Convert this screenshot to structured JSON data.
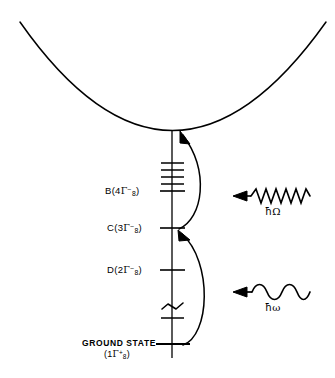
{
  "figure": {
    "background_color": "#ffffff",
    "ink_color": "#000000",
    "width": 335,
    "height": 378
  },
  "levels": [
    {
      "id": "B",
      "label_prefix": "B",
      "open_paren": "(",
      "number": "4",
      "gamma": "Γ",
      "subscript": "8",
      "superscript": "−",
      "close_paren": ")",
      "y": 191
    },
    {
      "id": "C",
      "label_prefix": "C",
      "open_paren": "(",
      "number": "3",
      "gamma": "Γ",
      "subscript": "8",
      "superscript": "−",
      "close_paren": ")",
      "y": 228
    },
    {
      "id": "D",
      "label_prefix": "D",
      "open_paren": "(",
      "number": "2",
      "gamma": "Γ",
      "subscript": "8",
      "superscript": "−",
      "close_paren": ")",
      "y": 270
    }
  ],
  "ground_state": {
    "title": "GROUND STATE",
    "open_paren": "(",
    "number": "1",
    "gamma": "Γ",
    "subscript": "8",
    "superscript": "+",
    "close_paren": ")",
    "y": 344
  },
  "unlabeled_ticks": [
    {
      "y": 163
    },
    {
      "y": 170
    },
    {
      "y": 177
    },
    {
      "y": 184
    }
  ],
  "break_mark": {
    "y": 306,
    "description": "axis-break squiggle"
  },
  "extra_tick": {
    "y": 318
  },
  "photons": [
    {
      "id": "omega-upper",
      "symbol_hbar": "ħ",
      "symbol_freq": "Ω",
      "waveform": "zigzag",
      "peaks": 6,
      "direction": "left",
      "wave_y": 196,
      "label_y": 212,
      "label_x": 276
    },
    {
      "id": "omega-lower",
      "symbol_hbar": "ħ",
      "symbol_freq": "ω",
      "waveform": "sine",
      "peaks": 4,
      "direction": "left",
      "wave_y": 292,
      "label_y": 308,
      "label_x": 276
    }
  ],
  "transitions": [
    {
      "id": "upper-transition",
      "from_level": "C",
      "to_level": "parabola-vertex",
      "arrow_at": "top"
    },
    {
      "id": "lower-transition",
      "from_level": "ground",
      "to_level": "C",
      "arrow_at": "top"
    }
  ],
  "potential_curve": {
    "type": "parabola",
    "vertex_x": 172,
    "vertex_y": 130,
    "left_end_x": 20,
    "right_end_x": 326,
    "end_y": 22
  },
  "axis": {
    "x": 172,
    "top_y": 130,
    "bottom_y": 358
  }
}
